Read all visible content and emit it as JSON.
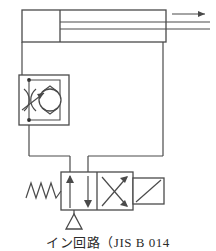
{
  "figure": {
    "caption": "イン回路（JIS B 014",
    "stroke_color": "#4a4a4a",
    "fill_color": "#ffffff",
    "background": "#ffffff",
    "width": 216,
    "height": 246
  },
  "components": {
    "cylinder": {
      "label": "double-acting cylinder",
      "x": 22,
      "y": 10,
      "width": 144,
      "height": 32,
      "piston_x": 60,
      "rod_y": 29,
      "rod_end_x": 210,
      "motion_arrow": {
        "label": "extend direction arrow",
        "x1": 173,
        "x2": 208,
        "y": 17
      }
    },
    "flow_control_valve": {
      "label": "one-way flow control valve",
      "x": 19,
      "y": 75,
      "width": 50,
      "height": 50,
      "check_valve_circle": {
        "cx": 50,
        "cy": 100,
        "r": 11
      },
      "throttle_label": "variable restrictor",
      "port_top": {
        "x": 29,
        "y": 80
      },
      "port_bottom": {
        "x": 29,
        "y": 120
      }
    },
    "directional_valve": {
      "label": "4/2 directional control valve, spring return, solenoid operated",
      "x": 61,
      "y": 172,
      "width": 72,
      "height": 38,
      "divider_x": 97,
      "spring": {
        "label": "return spring",
        "x1": 26,
        "x2": 61,
        "y": 191
      },
      "solenoid": {
        "label": "solenoid actuator",
        "x": 133,
        "y": 178,
        "width": 30,
        "height": 26
      },
      "port_a_arrow": "up-arrow",
      "port_t_arrow": "down-arrow",
      "crossed_arrows": "X-crossover"
    },
    "tank": {
      "label": "reservoir / vent triangle",
      "cx": 74,
      "cy": 222,
      "size": 13
    }
  },
  "connections": [
    {
      "name": "cylinder-cap-to-flow-valve",
      "path": "22,42 22,75"
    },
    {
      "name": "flow-valve-to-bus-left",
      "path": "29,125 29,156"
    },
    {
      "name": "cylinder-rod-side-down",
      "path": "163,42 163,156"
    },
    {
      "name": "bus-horizontal-left",
      "path": "29,156 70,156"
    },
    {
      "name": "bus-horizontal-right",
      "path": "88,156 163,156"
    },
    {
      "name": "port-p-riser",
      "path": "70,156 70,172"
    },
    {
      "name": "port-a-riser",
      "path": "88,156 88,172"
    },
    {
      "name": "valve-drain-to-tank",
      "path": "74,210 74,214"
    }
  ]
}
